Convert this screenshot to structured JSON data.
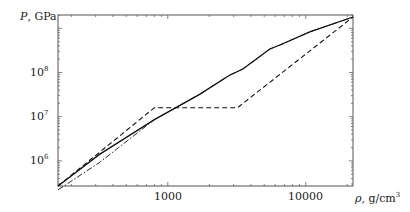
{
  "chart_data": {
    "type": "line",
    "title": "",
    "xlabel": "ρ, g/cm3",
    "ylabel": "P, GPa",
    "xscale": "log",
    "yscale": "log",
    "xlim": [
      160,
      22000
    ],
    "ylim": [
      270000,
      2000000000
    ],
    "grid": false,
    "legend": null,
    "x_ticks": [
      {
        "value": 1000,
        "label": "1000"
      },
      {
        "value": 10000,
        "label": "10000"
      }
    ],
    "y_ticks": [
      {
        "value": 1000000,
        "label": "10",
        "exp": "6"
      },
      {
        "value": 10000000,
        "label": "10",
        "exp": "7"
      },
      {
        "value": 100000000,
        "label": "10",
        "exp": "8"
      }
    ],
    "series": [
      {
        "name": "solid",
        "style": "solid",
        "x": [
          160,
          320,
          800,
          1700,
          2800,
          3500,
          5500,
          6500,
          10700,
          22000
        ],
        "y": [
          270000,
          1400000,
          8600000,
          32000000,
          87000000,
          120000000,
          340000000,
          420000000,
          830000000,
          1800000000
        ]
      },
      {
        "name": "dashed",
        "style": "dashed",
        "x": [
          160,
          800,
          3200,
          22000
        ],
        "y": [
          270000,
          16000000,
          16000000,
          1800000000
        ]
      },
      {
        "name": "dash-dot",
        "style": "dashdot",
        "x": [
          160,
          320,
          800,
          1700,
          2800,
          3500,
          5500,
          6500,
          10700,
          22000
        ],
        "y": [
          220000,
          920000,
          8600000,
          32000000,
          87000000,
          120000000,
          340000000,
          420000000,
          830000000,
          1800000000
        ]
      }
    ]
  },
  "labels": {
    "ylabel_sym": "P",
    "ylabel_unit": ", GPa",
    "xlabel_sym": "ρ",
    "xlabel_unit": ", g/cm",
    "xlabel_exp": "3",
    "ytick_base": "10",
    "ytick_6": "6",
    "ytick_7": "7",
    "ytick_8": "8",
    "xtick_1000": "1000",
    "xtick_10000": "10000"
  }
}
